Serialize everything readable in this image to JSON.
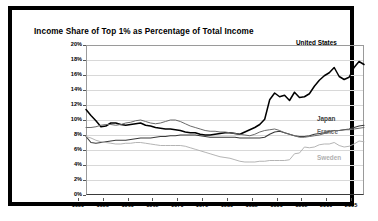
{
  "chart_title": "Income Share of Top 1% as Percentage of Total Income",
  "axis": {
    "y_ticks": [
      "20%",
      "18%",
      "16%",
      "14%",
      "12%",
      "10%",
      "8%",
      "6%",
      "4%",
      "2%",
      "0%"
    ],
    "x_ticks": [
      "1950",
      "1955",
      "1960",
      "1965",
      "1970",
      "1975",
      "1980",
      "1985",
      "1990",
      "1995",
      "2000",
      "2005"
    ]
  },
  "series_labels": {
    "united_states": "United States",
    "japan": "Japan",
    "france": "France",
    "sweden": "Sweden"
  },
  "colors": {
    "united_states": "#000000",
    "japan": "#3a3a3a",
    "france": "#6a6a6a",
    "sweden": "#b0b0b0",
    "grid": "#d8d8d8",
    "frame": "#000000"
  },
  "chart_data": {
    "type": "line",
    "title": "Income Share of Top 1% as Percentage of Total Income",
    "xlabel": "",
    "ylabel": "",
    "xlim": [
      1950,
      2006
    ],
    "ylim": [
      0,
      20
    ],
    "ytick_step": 2,
    "grid": true,
    "legend": "inline-right-of-series",
    "x": [
      1950,
      1951,
      1952,
      1953,
      1954,
      1955,
      1956,
      1957,
      1958,
      1959,
      1960,
      1961,
      1962,
      1963,
      1964,
      1965,
      1966,
      1967,
      1968,
      1969,
      1970,
      1971,
      1972,
      1973,
      1974,
      1975,
      1976,
      1977,
      1978,
      1979,
      1980,
      1981,
      1982,
      1983,
      1984,
      1985,
      1986,
      1987,
      1988,
      1989,
      1990,
      1991,
      1992,
      1993,
      1994,
      1995,
      1996,
      1997,
      1998,
      1999,
      2000,
      2001,
      2002,
      2003,
      2004,
      2005,
      2006
    ],
    "series": [
      {
        "name": "United States",
        "color": "#000000",
        "values": [
          11.4,
          10.6,
          9.9,
          9.1,
          9.2,
          9.6,
          9.6,
          9.4,
          9.3,
          9.4,
          9.5,
          9.6,
          9.3,
          9.2,
          9.0,
          8.9,
          8.8,
          8.8,
          8.7,
          8.6,
          8.4,
          8.3,
          8.3,
          8.1,
          8.0,
          8.0,
          8.1,
          8.2,
          8.3,
          8.3,
          8.2,
          8.1,
          8.4,
          8.7,
          9.0,
          9.4,
          10.1,
          12.7,
          13.6,
          13.1,
          13.3,
          12.6,
          13.7,
          13.0,
          13.1,
          13.5,
          14.5,
          15.3,
          15.9,
          16.3,
          17.0,
          15.8,
          15.4,
          15.7,
          17.0,
          17.8,
          17.4
        ]
      },
      {
        "name": "Japan",
        "color": "#3a3a3a",
        "values": [
          7.8,
          7.0,
          6.9,
          7.0,
          7.1,
          7.2,
          7.3,
          7.3,
          7.3,
          7.4,
          7.5,
          7.6,
          7.6,
          7.6,
          7.7,
          7.8,
          7.8,
          7.9,
          7.9,
          8.0,
          8.0,
          8.0,
          8.0,
          7.9,
          7.8,
          7.7,
          7.7,
          7.7,
          7.7,
          7.7,
          7.7,
          7.6,
          7.6,
          7.6,
          7.6,
          7.6,
          7.7,
          8.1,
          8.4,
          8.5,
          8.3,
          8.1,
          7.9,
          7.8,
          7.8,
          7.9,
          8.1,
          8.2,
          8.3,
          8.5,
          8.6,
          8.6,
          8.7,
          8.8,
          9.0,
          9.2,
          9.3
        ]
      },
      {
        "name": "France",
        "color": "#6a6a6a",
        "values": [
          9.0,
          9.0,
          9.1,
          9.3,
          9.4,
          9.4,
          9.3,
          9.4,
          9.6,
          9.7,
          9.9,
          10.0,
          9.8,
          9.6,
          9.5,
          9.6,
          9.8,
          10.0,
          10.0,
          9.8,
          9.5,
          9.2,
          9.0,
          8.8,
          8.6,
          8.5,
          8.5,
          8.4,
          8.4,
          8.3,
          8.2,
          8.1,
          8.0,
          7.9,
          8.1,
          8.4,
          8.6,
          8.7,
          8.8,
          8.6,
          8.3,
          8.1,
          7.9,
          7.7,
          7.7,
          7.8,
          7.9,
          8.0,
          8.2,
          8.4,
          8.6,
          8.6,
          8.7,
          8.7,
          8.8,
          8.9,
          9.0
        ]
      },
      {
        "name": "Sweden",
        "color": "#b0b0b0",
        "values": [
          7.8,
          7.6,
          7.3,
          7.1,
          7.0,
          6.9,
          6.8,
          6.8,
          6.9,
          6.9,
          7.0,
          7.0,
          6.9,
          6.8,
          6.7,
          6.6,
          6.6,
          6.6,
          6.6,
          6.6,
          6.5,
          6.3,
          6.1,
          5.9,
          5.7,
          5.5,
          5.3,
          5.1,
          5.0,
          4.9,
          4.7,
          4.5,
          4.4,
          4.4,
          4.4,
          4.5,
          4.5,
          4.6,
          4.6,
          4.6,
          4.6,
          4.7,
          5.5,
          5.6,
          6.4,
          6.3,
          6.4,
          6.7,
          6.8,
          6.8,
          7.0,
          6.6,
          6.4,
          6.5,
          6.8,
          7.2,
          7.1
        ]
      }
    ]
  }
}
